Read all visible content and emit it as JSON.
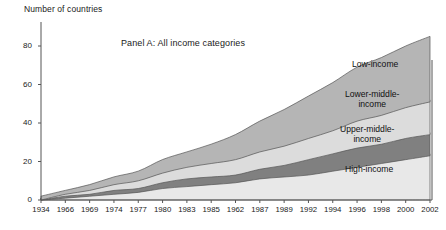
{
  "chart_data": {
    "type": "area",
    "title": "Panel A: All income categories",
    "ylabel": "Number of countries",
    "xlabel": "",
    "stacked": true,
    "grid": false,
    "legend_position": "inline-right",
    "ylim": [
      0,
      88
    ],
    "yticks": [
      0,
      20,
      40,
      60,
      80
    ],
    "ytick_labels": [
      "0",
      "20",
      "40",
      "60",
      "80"
    ],
    "categories": [
      "1934",
      "1966",
      "1969",
      "1974",
      "1977",
      "1980",
      "1983",
      "1985",
      "1962",
      "1987",
      "1989",
      "1992",
      "1994",
      "1996",
      "1998",
      "2000",
      "2002"
    ],
    "series": [
      {
        "name": "High-income",
        "color": "#e8e8e8",
        "values": [
          1,
          2,
          3,
          4,
          5,
          7,
          8,
          9,
          10,
          12,
          13,
          14,
          16,
          18,
          20,
          22,
          24
        ]
      },
      {
        "name": "Upper-middle-income",
        "color": "#808080",
        "values": [
          0,
          1,
          1,
          2,
          2,
          3,
          4,
          4,
          4,
          5,
          6,
          8,
          9,
          10,
          10,
          11,
          11
        ]
      },
      {
        "name": "Lower-middle-income",
        "color": "#dcdcdc",
        "values": [
          0,
          1,
          2,
          3,
          4,
          5,
          6,
          7,
          8,
          9,
          10,
          11,
          12,
          14,
          15,
          16,
          17
        ]
      },
      {
        "name": "Low-income",
        "color": "#b5b5b5",
        "values": [
          0,
          1,
          2,
          3,
          4,
          6,
          7,
          9,
          12,
          15,
          18,
          21,
          24,
          27,
          29,
          31,
          33
        ]
      }
    ],
    "cumulative_tops": {
      "high_income": [
        1,
        2,
        3,
        4,
        5,
        7,
        8,
        9,
        10,
        12,
        13,
        14,
        16,
        18,
        20,
        22,
        24
      ],
      "upper_middle_income": [
        1,
        3,
        4,
        6,
        7,
        10,
        12,
        13,
        14,
        17,
        19,
        22,
        25,
        28,
        30,
        33,
        35
      ],
      "lower_middle_income": [
        1,
        4,
        6,
        9,
        11,
        15,
        18,
        20,
        22,
        26,
        29,
        33,
        37,
        42,
        45,
        49,
        52
      ],
      "low_income": [
        2,
        5,
        8,
        12,
        15,
        21,
        25,
        29,
        34,
        41,
        47,
        54,
        61,
        69,
        74,
        80,
        85
      ]
    },
    "series_labels": [
      {
        "name": "Low-income",
        "lines": [
          "Low-income"
        ]
      },
      {
        "name": "Lower-middle-income",
        "lines": [
          "Lower-middle-",
          "income"
        ]
      },
      {
        "name": "Upper-middle-income",
        "lines": [
          "Upper-middle-",
          "income"
        ]
      },
      {
        "name": "High-income",
        "lines": [
          "High-income"
        ]
      }
    ]
  },
  "colors": {
    "axis": "#555555",
    "outline": "#555555",
    "text": "#1a1a1a",
    "background": "#ffffff"
  }
}
